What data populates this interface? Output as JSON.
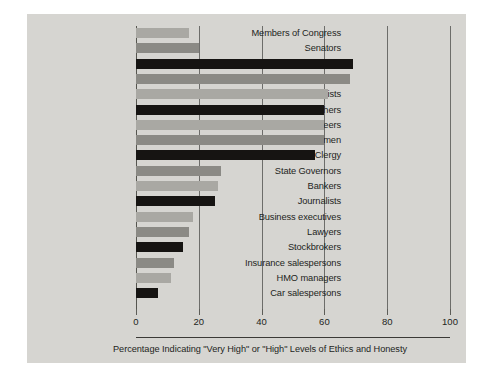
{
  "chart_data": {
    "type": "bar",
    "orientation": "horizontal",
    "title": "",
    "xlabel": "Percentage Indicating \"Very High\" or \"High\" Levels of Ethics and Honesty",
    "ylabel": "",
    "xlim": [
      0,
      100
    ],
    "xticks": [
      0,
      20,
      40,
      60,
      80,
      100
    ],
    "xticklabels": [
      "0",
      "20",
      "40",
      "60",
      "80",
      "100"
    ],
    "grid": true,
    "legend": "none",
    "categories": [
      "Members of Congress",
      "Senators",
      "Medical doctors",
      "Pharmacists",
      "Dentists",
      "College teachers",
      "Engineers",
      "Policemen",
      "Clergy",
      "State Governors",
      "Bankers",
      "Journalists",
      "Business executives",
      "Lawyers",
      "Stockbrokers",
      "Insurance salespersons",
      "HMO managers",
      "Car salespersons"
    ],
    "values": [
      17,
      20,
      69,
      68,
      61,
      60,
      60,
      60,
      57,
      27,
      26,
      25,
      18,
      17,
      15,
      12,
      11,
      7
    ],
    "bar_shades": [
      "light",
      "mid",
      "dark",
      "mid",
      "light",
      "dark",
      "light",
      "mid",
      "dark",
      "mid",
      "light",
      "dark",
      "light",
      "mid",
      "dark",
      "mid",
      "light",
      "dark"
    ]
  },
  "colors": {
    "panel_background": "#d6d5d1",
    "page_background": "#ffffff",
    "bar_light": "#a9a8a3",
    "bar_mid": "#8b8a85",
    "bar_dark": "#161412",
    "gridline": "#6d6d6a",
    "axis": "#55554f",
    "text": "#231f1c"
  }
}
